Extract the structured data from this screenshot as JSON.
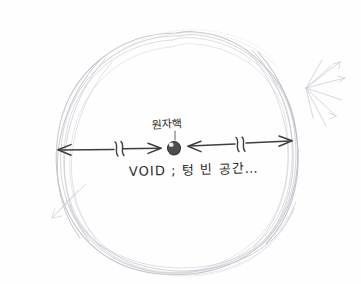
{
  "canvas": {
    "width": 361,
    "height": 284,
    "background_color": "#fefefe",
    "medium": "pencil-sketch"
  },
  "colors": {
    "paper": "#fefefe",
    "faint_pencil": "#c9c9cf",
    "mid_pencil": "#b4b4bc",
    "ink_dark": "#3a3a3a",
    "nucleus_fill": "#4a4a4a",
    "nucleus_highlight": "#f2f2f2",
    "text": "#2b2b2b"
  },
  "labels": {
    "nucleus": "원자핵",
    "void": "VOID ; 텅 빈 공간…"
  },
  "diagram": {
    "title_text": "원자핵",
    "caption_text": "VOID ; 텅 빈 공간…",
    "atom_boundary": {
      "name": "electron-cloud-outline",
      "center_x": 176,
      "center_y": 152,
      "radius_x": 122,
      "radius_y": 120,
      "stroke_count": 7
    },
    "nucleus": {
      "name": "atomic-nucleus",
      "center_x": 174,
      "center_y": 148,
      "radius": 6.5
    },
    "arrows": [
      {
        "name": "left-radius-arrow",
        "from_x": 57,
        "to_x": 162,
        "y": 149,
        "double_headed": true,
        "break_mark_x": 118
      },
      {
        "name": "right-radius-arrow",
        "from_x": 188,
        "to_x": 292,
        "y": 143,
        "double_headed": true,
        "break_mark_x": 240
      }
    ],
    "radiating_spokes": {
      "name": "right-side-spokes",
      "origin_x": 306,
      "origin_y": 88,
      "count": 7
    }
  }
}
